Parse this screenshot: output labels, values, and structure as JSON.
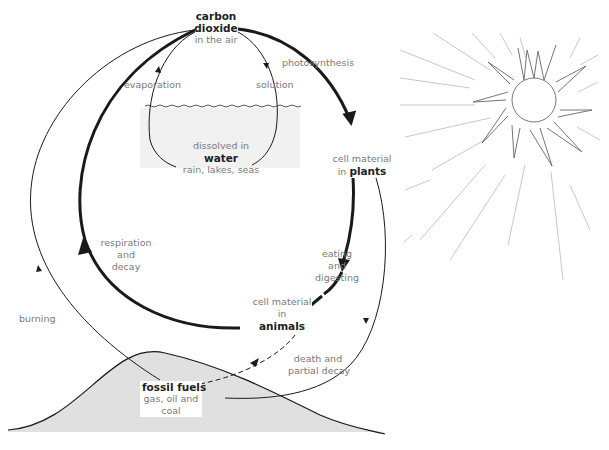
{
  "nodes": {
    "co2": {
      "name_line1": "carbon",
      "name_line2": "dioxide",
      "sub": "in the air"
    },
    "water": {
      "prefix": "dissolved in",
      "name": "water",
      "sub": "rain, lakes, seas"
    },
    "plants": {
      "prefix": "cell material",
      "in": "in",
      "name": "plants"
    },
    "animals": {
      "prefix": "cell material",
      "in": "in",
      "name": "animals"
    },
    "fossil": {
      "name": "fossil fuels",
      "sub1": "gas, oil and",
      "sub2": "coal"
    }
  },
  "processes": {
    "evaporation": "evaporation",
    "solution": "solution",
    "photosynthesis": "photosynthesis",
    "eating": [
      "eating",
      "and",
      "digesting"
    ],
    "respiration": [
      "respiration",
      "and",
      "decay"
    ],
    "burning": "burning",
    "death": [
      "death and",
      "partial decay"
    ]
  },
  "colors": {
    "line": "#1a1a1a",
    "label": "#7a7a7a",
    "hill_fill": "#e0e0e0",
    "water_fill": "#ececec",
    "sun_rays": "#c8c8c8"
  }
}
